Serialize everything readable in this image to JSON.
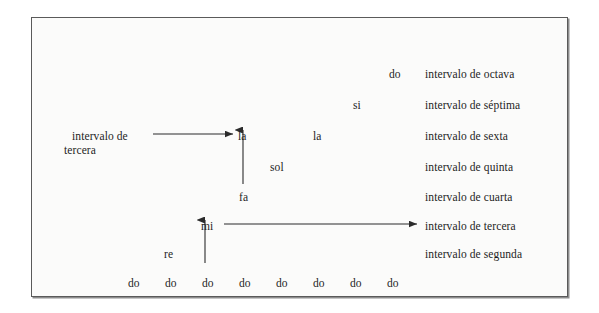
{
  "figure": {
    "background_color": "#fbfbfa",
    "frame_color": "#5a5a5a",
    "text_color": "#1d1d1d"
  },
  "interval_labels": [
    {
      "text": "intervalo de octava",
      "x": 393,
      "y": 50
    },
    {
      "text": "intervalo de séptima",
      "x": 393,
      "y": 81
    },
    {
      "text": "intervalo de sexta",
      "x": 393,
      "y": 112
    },
    {
      "text": "intervalo de quinta",
      "x": 393,
      "y": 143
    },
    {
      "text": "intervalo de cuarta",
      "x": 393,
      "y": 173
    },
    {
      "text": "intervalo de tercera",
      "x": 393,
      "y": 202
    },
    {
      "text": "intervalo de segunda",
      "x": 393,
      "y": 230
    }
  ],
  "left_label": {
    "line1": "intervalo de",
    "line2": "tercera",
    "x": 32,
    "y": 111
  },
  "notes": [
    {
      "name": "do",
      "x": 357,
      "y": 50
    },
    {
      "name": "si",
      "x": 321,
      "y": 81
    },
    {
      "name": "la",
      "x": 281,
      "y": 112
    },
    {
      "name": "la",
      "x": 206,
      "y": 112
    },
    {
      "name": "sol",
      "x": 238,
      "y": 143
    },
    {
      "name": "fa",
      "x": 207,
      "y": 173
    },
    {
      "name": "mi",
      "x": 169,
      "y": 202
    },
    {
      "name": "re",
      "x": 132,
      "y": 230
    }
  ],
  "baseline_notes": [
    {
      "name": "do",
      "x": 96,
      "y": 259
    },
    {
      "name": "do",
      "x": 133,
      "y": 259
    },
    {
      "name": "do",
      "x": 170,
      "y": 259
    },
    {
      "name": "do",
      "x": 207,
      "y": 259
    },
    {
      "name": "do",
      "x": 244,
      "y": 259
    },
    {
      "name": "do",
      "x": 281,
      "y": 259
    },
    {
      "name": "do",
      "x": 318,
      "y": 259
    },
    {
      "name": "do",
      "x": 355,
      "y": 259
    }
  ],
  "arrows": [
    {
      "id": "arrow-la-to-left-label",
      "direction": "left",
      "x1": 201,
      "y1": 116,
      "x2": 117,
      "y2": 116
    },
    {
      "id": "arrow-fa-to-la",
      "direction": "up",
      "x1": 211,
      "y1": 166,
      "x2": 211,
      "y2": 110
    },
    {
      "id": "arrow-mi-to-tercera",
      "direction": "right",
      "x1": 192,
      "y1": 206,
      "x2": 389,
      "y2": 206
    },
    {
      "id": "arrow-do-to-mi",
      "direction": "up",
      "x1": 173,
      "y1": 245,
      "x2": 173,
      "y2": 200
    }
  ]
}
